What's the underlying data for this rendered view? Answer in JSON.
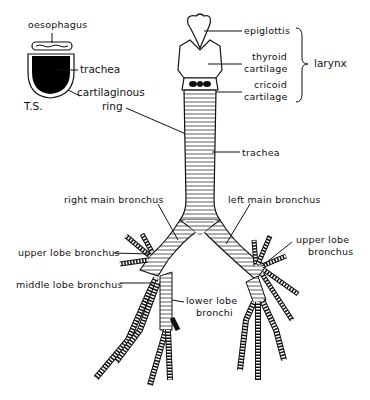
{
  "diagram": {
    "cross_section": {
      "label": "T.S.",
      "labels": {
        "oesophagus": "oesophagus",
        "trachea": "trachea",
        "cartilaginous_ring_line1": "cartilaginous",
        "cartilaginous_ring_line2": "ring"
      }
    },
    "larynx": {
      "group_label": "larynx",
      "epiglottis": "epiglottis",
      "thyroid_line1": "thyroid",
      "thyroid_line2": "cartilage",
      "cricoid_line1": "cricoid",
      "cricoid_line2": "cartilage"
    },
    "trachea_label": "trachea",
    "bronchi": {
      "right_main": "right main bronchus",
      "left_main": "left main bronchus",
      "right_upper_lobe": "upper lobe bronchus",
      "left_upper_lobe_line1": "upper lobe",
      "left_upper_lobe_line2": "bronchus",
      "middle_lobe": "middle lobe bronchus",
      "lower_lobe_line1": "lower lobe",
      "lower_lobe_line2": "bronchi"
    },
    "colors": {
      "ink": "#111111",
      "background": "#ffffff"
    }
  }
}
